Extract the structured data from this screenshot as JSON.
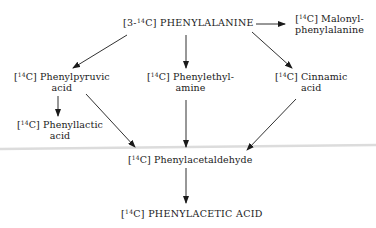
{
  "diagram": {
    "type": "metabolic-pathway",
    "nodes": {
      "phenylalanine": {
        "prefix": "[3-",
        "isotope": "14",
        "suffix": "C] PHENYLALANINE"
      },
      "malonyl": {
        "prefix": "[",
        "isotope": "14",
        "suffix": "C] Malonyl-",
        "line2": "phenylalanine"
      },
      "phenylpyruvic": {
        "prefix": "[",
        "isotope": "14",
        "suffix": "C] Phenylpyruvic",
        "line2": "acid"
      },
      "phenylethylamine": {
        "prefix": "[",
        "isotope": "14",
        "suffix": "C] Phenylethyl-",
        "line2": "amine"
      },
      "cinnamic": {
        "prefix": "[",
        "isotope": "14",
        "suffix": "C] Cinnamic",
        "line2": "acid"
      },
      "phenyllactic": {
        "prefix": "[",
        "isotope": "14",
        "suffix": "C] Phenyllactic",
        "line2": "acid"
      },
      "phenylacetaldehyde": {
        "prefix": "[",
        "isotope": "14",
        "suffix": "C] Phenylacetaldehyde"
      },
      "phenylacetic": {
        "prefix": "[",
        "isotope": "14",
        "suffix": "C] PHENYLACETIC ACID"
      }
    },
    "edges": [
      {
        "from": "phenylalanine",
        "to": "malonyl"
      },
      {
        "from": "phenylalanine",
        "to": "phenylpyruvic"
      },
      {
        "from": "phenylalanine",
        "to": "phenylethylamine"
      },
      {
        "from": "phenylalanine",
        "to": "cinnamic"
      },
      {
        "from": "phenylpyruvic",
        "to": "phenyllactic"
      },
      {
        "from": "phenylpyruvic",
        "to": "phenylacetaldehyde"
      },
      {
        "from": "phenylethylamine",
        "to": "phenylacetaldehyde"
      },
      {
        "from": "cinnamic",
        "to": "phenylacetaldehyde"
      },
      {
        "from": "phenylacetaldehyde",
        "to": "phenylacetic"
      }
    ],
    "colors": {
      "ink": "#1a1a1a",
      "background": "#ffffff",
      "scan_line": "#d6d6d6"
    }
  }
}
